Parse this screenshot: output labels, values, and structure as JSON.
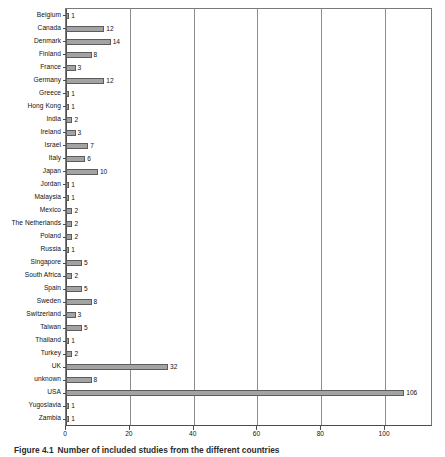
{
  "caption": {
    "number": "Figure 4.1",
    "text": "Number of included studies from the different countries"
  },
  "colors": {
    "bar_fill": "#a3a3a3",
    "bar_stroke": "#5c5c5c",
    "grid": "#8c8c8c",
    "axis": "#4d4d4d",
    "text": "#111111",
    "background": "#ffffff"
  },
  "chart_data": {
    "type": "bar",
    "orientation": "horizontal",
    "title": "",
    "xlabel": "",
    "ylabel": "",
    "xlim": [
      0,
      115
    ],
    "xticks": [
      0,
      20,
      40,
      60,
      80,
      100
    ],
    "grid": true,
    "legend": false,
    "data_labels": true,
    "categories": [
      "Belgium",
      "Canada",
      "Denmark",
      "Finland",
      "France",
      "Germany",
      "Greece",
      "Hong Kong",
      "India",
      "Ireland",
      "Israel",
      "Italy",
      "Japan",
      "Jordan",
      "Malaysia",
      "Mexico",
      "The Netherlands",
      "Poland",
      "Russia",
      "Singapore",
      "South Africa",
      "Spain",
      "Sweden",
      "Switzerland",
      "Taiwan",
      "Thailand",
      "Turkey",
      "UK",
      "unknown",
      "USA",
      "Yugoslavia",
      "Zambia"
    ],
    "values": [
      1,
      12,
      14,
      8,
      3,
      12,
      1,
      1,
      2,
      3,
      7,
      6,
      10,
      1,
      1,
      2,
      2,
      2,
      1,
      5,
      2,
      5,
      8,
      3,
      5,
      1,
      2,
      32,
      8,
      106,
      1,
      1
    ]
  }
}
